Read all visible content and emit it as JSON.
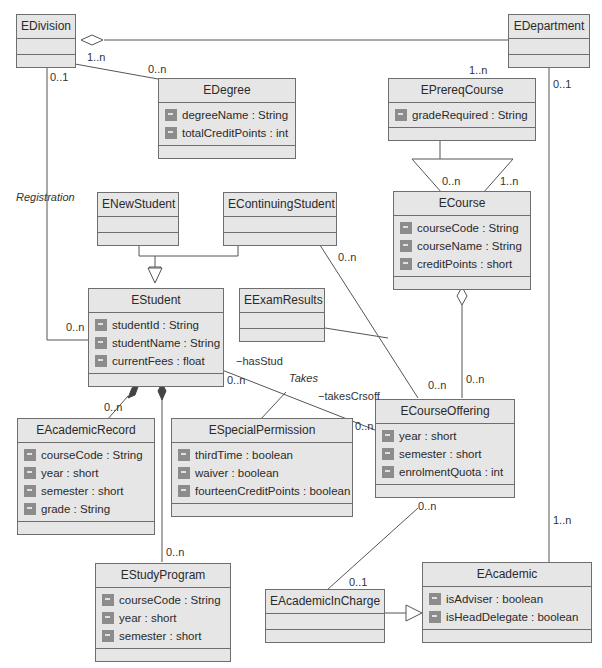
{
  "classes": {
    "division": {
      "name": "EDivision",
      "attrs": []
    },
    "department": {
      "name": "EDepartment",
      "attrs": []
    },
    "degree": {
      "name": "EDegree",
      "attrs": [
        "degreeName : String",
        "totalCreditPoints : int"
      ]
    },
    "prereq": {
      "name": "EPrereqCourse",
      "attrs": [
        "gradeRequired : String"
      ]
    },
    "newStudent": {
      "name": "ENewStudent",
      "attrs": []
    },
    "contStudent": {
      "name": "EContinuingStudent",
      "attrs": []
    },
    "course": {
      "name": "ECourse",
      "attrs": [
        "courseCode : String",
        "courseName : String",
        "creditPoints : short"
      ]
    },
    "student": {
      "name": "EStudent",
      "attrs": [
        "studentId : String",
        "studentName : String",
        "currentFees : float"
      ]
    },
    "examResults": {
      "name": "EExamResults",
      "attrs": []
    },
    "academicRecord": {
      "name": "EAcademicRecord",
      "attrs": [
        "courseCode : String",
        "year : short",
        "semester : short",
        "grade : String"
      ]
    },
    "specialPermission": {
      "name": "ESpecialPermission",
      "attrs": [
        "thirdTime : boolean",
        "waiver : boolean",
        "fourteenCreditPoints : boolean"
      ]
    },
    "courseOffering": {
      "name": "ECourseOffering",
      "attrs": [
        "year : short",
        "semester : short",
        "enrolmentQuota : int"
      ]
    },
    "studyProgram": {
      "name": "EStudyProgram",
      "attrs": [
        "courseCode : String",
        "year : short",
        "semester : short"
      ]
    },
    "academicInCharge": {
      "name": "EAcademicInCharge",
      "attrs": []
    },
    "academic": {
      "name": "EAcademic",
      "attrs": [
        "isAdviser : boolean",
        "isHeadDelegate : boolean"
      ]
    }
  },
  "labels": {
    "div_deg_1n": "1..n",
    "div_deg_0n": "0..n",
    "div_01": "0..1",
    "registration": "Registration",
    "reg_0n": "0..n",
    "dept_prereq_1n": "1..n",
    "dept_01": "0..1",
    "prereq_0n": "0..n",
    "prereq_1n": "1..n",
    "cont_0n": "0..n",
    "hasStud": "−hasStud",
    "takes": "Takes",
    "takesCrsoff": "−takesCrsoff",
    "stud_0n": "0..n",
    "offer_left_0n": "0..n",
    "offer_top_0n": "0..n",
    "course_offer_0n": "0..n",
    "record_0n": "0..n",
    "program_0n": "0..n",
    "offer_bottom_0n": "0..n",
    "incharge_01": "0..1",
    "academic_1n": "1..n"
  }
}
